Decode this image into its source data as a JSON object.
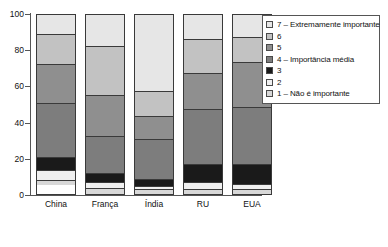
{
  "chart_data": {
    "type": "bar",
    "subtype": "stacked-percent",
    "title": "",
    "xlabel": "",
    "ylabel": "",
    "ylim": [
      0,
      100
    ],
    "yticks": [
      0,
      20,
      40,
      60,
      80,
      100
    ],
    "ytick_labels": [
      "0",
      "20",
      "40",
      "60",
      "80",
      "100"
    ],
    "grid": false,
    "legend_position": "right",
    "categories": [
      "China",
      "França",
      "Índia",
      "RU",
      "EUA"
    ],
    "series": [
      {
        "name": "1 – Não é importante",
        "key": "1",
        "color": "#d8d8d8",
        "values": [
          2,
          3,
          2,
          2,
          2
        ]
      },
      {
        "name": "2",
        "key": "2",
        "color": "#f0f0f0",
        "values": [
          6,
          3,
          2,
          4,
          3
        ]
      },
      {
        "name": "3",
        "key": "3",
        "color": "#1a1a1a",
        "values": [
          7,
          5,
          4,
          10,
          11
        ]
      },
      {
        "name": "4 – Importância média",
        "key": "4",
        "color": "#7d7d7d",
        "values": [
          30,
          21,
          22,
          31,
          32
        ]
      },
      {
        "name": "5",
        "key": "5",
        "color": "#8f8f8f",
        "values": [
          22,
          23,
          13,
          20,
          25
        ]
      },
      {
        "name": "6",
        "key": "6",
        "color": "#c2c2c2",
        "values": [
          17,
          27,
          14,
          19,
          14
        ]
      },
      {
        "name": "7 – Extremamente importante",
        "key": "7",
        "color": "#e6e6e6",
        "values": [
          11,
          18,
          43,
          14,
          13
        ]
      }
    ]
  },
  "legend": {
    "items": [
      {
        "label": "7 – Extremamente importante",
        "color": "#e6e6e6"
      },
      {
        "label": "6",
        "color": "#c2c2c2"
      },
      {
        "label": "5",
        "color": "#8f8f8f"
      },
      {
        "label": "4 – Importância média",
        "color": "#7d7d7d"
      },
      {
        "label": "3",
        "color": "#1a1a1a"
      },
      {
        "label": "2",
        "color": "#f0f0f0"
      },
      {
        "label": "1 – Não é importante",
        "color": "#d8d8d8"
      }
    ]
  }
}
